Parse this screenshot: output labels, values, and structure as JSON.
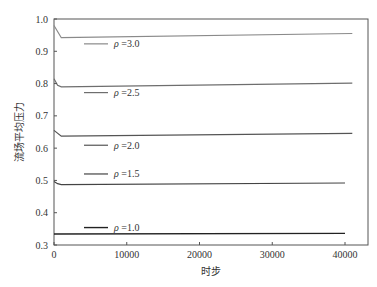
{
  "chart_data": {
    "type": "line",
    "title": "",
    "xlabel": "时步",
    "ylabel": "流场平均压力",
    "xlim": [
      0,
      43000
    ],
    "ylim": [
      0.3,
      1.0
    ],
    "xticks": [
      0,
      10000,
      20000,
      30000,
      40000
    ],
    "xtick_labels": [
      "0",
      "10000",
      "20000",
      "30000",
      "40000"
    ],
    "yticks": [
      0.3,
      0.4,
      0.5,
      0.6,
      0.7,
      0.8,
      0.9,
      1.0
    ],
    "ytick_labels": [
      "0.3",
      "0.4",
      "0.5",
      "0.6",
      "0.7",
      "0.8",
      "0.9",
      "1.0"
    ],
    "grid": false,
    "legend_position": "inline-left",
    "series": [
      {
        "name": "ρ=3.0",
        "label_symbol": "ρ",
        "label_value": "=3.0",
        "color": "#8a8a8a",
        "width": 1.2,
        "x": [
          0,
          1000,
          41000
        ],
        "y": [
          0.98,
          0.942,
          0.955
        ],
        "legend_y": 0.923
      },
      {
        "name": "ρ=2.5",
        "label_symbol": "ρ",
        "label_value": "=2.5",
        "color": "#6e6e6e",
        "width": 1.2,
        "x": [
          0,
          500,
          1000,
          41000
        ],
        "y": [
          0.815,
          0.795,
          0.79,
          0.801
        ],
        "legend_y": 0.772
      },
      {
        "name": "ρ=2.0",
        "label_symbol": "ρ",
        "label_value": "=2.0",
        "color": "#555555",
        "width": 1.2,
        "x": [
          0,
          1000,
          41000
        ],
        "y": [
          0.655,
          0.637,
          0.646
        ],
        "legend_y": 0.609
      },
      {
        "name": "ρ=1.5",
        "label_symbol": "ρ",
        "label_value": "=1.5",
        "color": "#444444",
        "width": 1.2,
        "x": [
          0,
          500,
          1000,
          40000
        ],
        "y": [
          0.497,
          0.49,
          0.487,
          0.492
        ],
        "legend_y": 0.52
      },
      {
        "name": "ρ=1.0",
        "label_symbol": "ρ",
        "label_value": "=1.0",
        "color": "#222222",
        "width": 1.4,
        "x": [
          0,
          40000
        ],
        "y": [
          0.334,
          0.336
        ],
        "legend_y": 0.354
      }
    ]
  }
}
